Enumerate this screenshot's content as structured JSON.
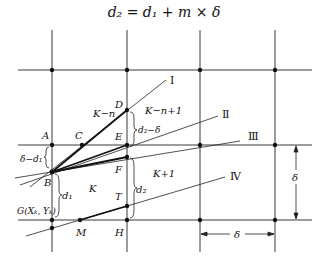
{
  "formula": "d₂ = d₁ + m × δ",
  "grid": {
    "vertical_x": [
      52,
      127,
      200,
      275
    ],
    "horizontal_y": [
      70,
      145,
      220
    ],
    "node_points": [
      [
        52,
        70
      ],
      [
        127,
        70
      ],
      [
        200,
        70
      ],
      [
        275,
        70
      ],
      [
        200,
        145
      ],
      [
        275,
        145
      ],
      [
        200,
        220
      ],
      [
        275,
        220
      ]
    ]
  },
  "points": {
    "A": {
      "label": "A",
      "x": 52,
      "y": 145
    },
    "B": {
      "label": "B",
      "x": 52,
      "y": 172
    },
    "C": {
      "label": "C",
      "x": 82,
      "y": 145
    },
    "D": {
      "label": "D",
      "x": 127,
      "y": 110
    },
    "E": {
      "label": "E",
      "x": 127,
      "y": 145
    },
    "F": {
      "label": "F",
      "x": 127,
      "y": 157
    },
    "T": {
      "label": "T",
      "x": 127,
      "y": 206
    },
    "H": {
      "label": "H",
      "x": 127,
      "y": 220
    },
    "M": {
      "label": "M",
      "x": 80,
      "y": 220
    },
    "G": {
      "label": "G(Xₖ, Yₖ)",
      "x": 52,
      "y": 220
    }
  },
  "lines": [
    {
      "label": "Ⅰ"
    },
    {
      "label": "Ⅱ"
    },
    {
      "label": "Ⅲ"
    },
    {
      "label": "Ⅳ"
    }
  ],
  "regions": {
    "k_minus_n": "K−n",
    "k_minus_n_plus_1": "K−n+1",
    "k": "K",
    "k_plus_1": "K+1"
  },
  "dimensions": {
    "d2_minus_delta": "d₂−δ",
    "delta_minus_d1": "δ−d₁",
    "d1": "d₁",
    "d2": "d₂",
    "delta_vertical": "δ",
    "delta_horizontal": "δ"
  }
}
